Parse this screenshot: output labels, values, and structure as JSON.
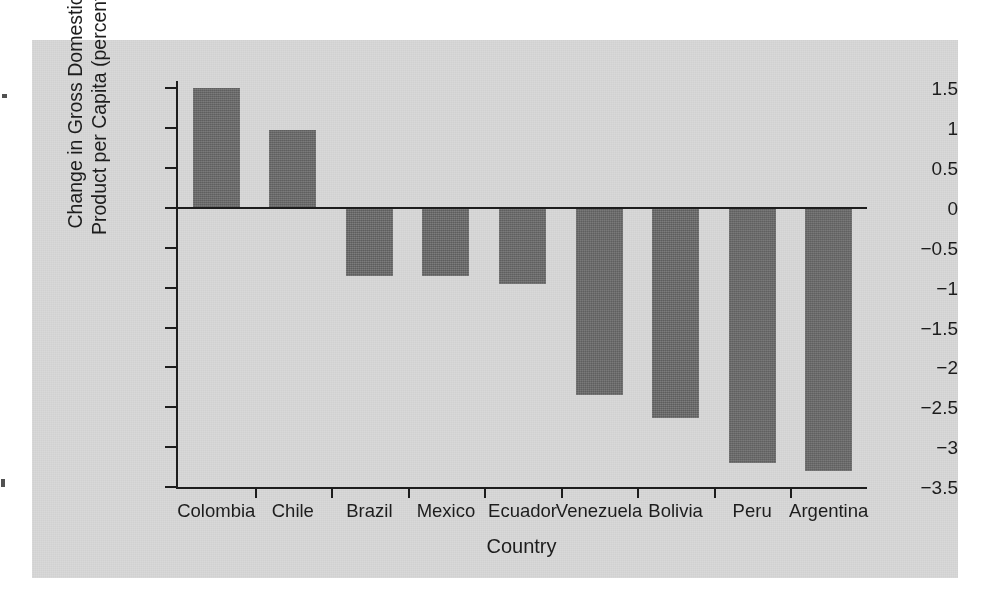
{
  "figure": {
    "panel_background": "#d9d9d9",
    "page_background": "#ffffff",
    "bar_color": "#6b6b6b",
    "axis_color": "#1d1d1d"
  },
  "axes": {
    "y_title_line1": "Change in Gross Domestic",
    "y_title_line2": "Product per Capita (percent)",
    "x_title": "Country",
    "y_tick_labels": [
      "1.5",
      "1",
      "0.5",
      "0",
      "−0.5",
      "−1",
      "−1.5",
      "−2",
      "−2.5",
      "−3",
      "−3.5"
    ],
    "y_tick_values": [
      1.5,
      1,
      0.5,
      0,
      -0.5,
      -1,
      -1.5,
      -2,
      -2.5,
      -3,
      -3.5
    ]
  },
  "chart_data": {
    "type": "bar",
    "title": "",
    "xlabel": "Country",
    "ylabel": "Change in Gross Domestic Product per Capita (percent)",
    "categories": [
      "Colombia",
      "Chile",
      "Brazil",
      "Mexico",
      "Ecuador",
      "Venezuela",
      "Bolivia",
      "Peru",
      "Argentina"
    ],
    "values": [
      1.5,
      0.98,
      -0.85,
      -0.85,
      -0.95,
      -2.35,
      -2.63,
      -3.2,
      -3.3
    ],
    "ylim": [
      -3.5,
      1.5
    ],
    "yticks": [
      -3.5,
      -3,
      -2.5,
      -2,
      -1.5,
      -1,
      -0.5,
      0,
      0.5,
      1,
      1.5
    ],
    "grid": false,
    "legend": null,
    "orientation": "vertical",
    "zero_line": true
  }
}
